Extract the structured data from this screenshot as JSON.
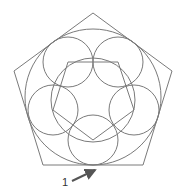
{
  "diagram": {
    "colors": {
      "stroke": "#7a7a7a",
      "arrow": "#555555",
      "label": "#333333"
    },
    "outer_pentagon": {
      "points": [
        [
          93,
          13
        ],
        [
          172,
          71
        ],
        [
          143,
          165
        ],
        [
          43,
          165
        ],
        [
          14,
          71
        ]
      ]
    },
    "inscribed_circle": {
      "cx": 93,
      "cy": 97,
      "r": 68
    },
    "middle_circle": {
      "cx": 93,
      "cy": 100,
      "r": 42
    },
    "inner_pentagon": {
      "points": [
        [
          68,
          62
        ],
        [
          118,
          62
        ],
        [
          134,
          110
        ],
        [
          93,
          140
        ],
        [
          53,
          110
        ]
      ]
    },
    "small_circles": [
      {
        "cx": 68,
        "cy": 62,
        "r": 25
      },
      {
        "cx": 118,
        "cy": 62,
        "r": 25
      },
      {
        "cx": 134,
        "cy": 110,
        "r": 25
      },
      {
        "cx": 93,
        "cy": 140,
        "r": 25
      },
      {
        "cx": 53,
        "cy": 110,
        "r": 25
      }
    ],
    "callout": {
      "label": "1",
      "label_x": 62,
      "label_y": 186,
      "arrow_from": [
        72,
        181
      ],
      "arrow_to": [
        95,
        170
      ]
    }
  }
}
